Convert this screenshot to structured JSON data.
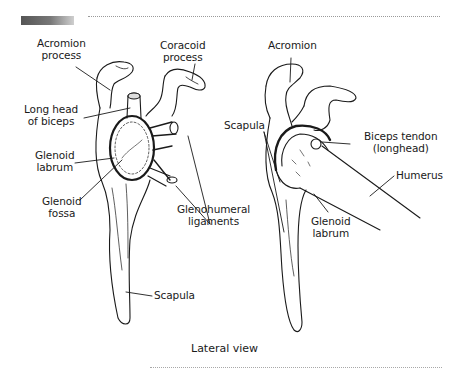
{
  "figure": {
    "caption": "Lateral view",
    "left_view": {
      "labels": {
        "acromion_process": [
          "Acromion",
          "process"
        ],
        "coracoid_process": [
          "Coracoid",
          "process"
        ],
        "long_head_of_biceps": [
          "Long head",
          "of biceps"
        ],
        "glenoid_labrum": [
          "Glenoid",
          "labrum"
        ],
        "glenoid_fossa": [
          "Glenoid",
          "fossa"
        ],
        "glenohumeral_ligaments": [
          "Glenohumeral",
          "ligaments"
        ],
        "scapula": [
          "Scapula"
        ]
      }
    },
    "right_view": {
      "labels": {
        "acromion": [
          "Acromion"
        ],
        "scapula": [
          "Scapula"
        ],
        "biceps_tendon": [
          "Biceps tendon",
          "(longhead)"
        ],
        "humerus": [
          "Humerus"
        ],
        "glenoid_labrum": [
          "Glenoid",
          "labrum"
        ]
      }
    }
  },
  "colors": {
    "ink": "#1a1a1a",
    "header_bar": "#666666",
    "background": "#ffffff"
  }
}
